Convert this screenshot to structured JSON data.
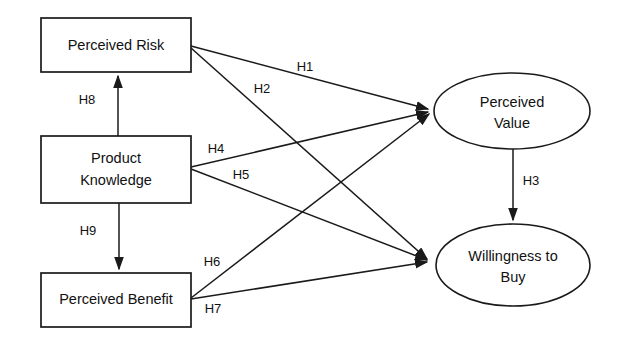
{
  "diagram": {
    "type": "path-model",
    "colors": {
      "stroke": "#1a1a1a",
      "fill": "#ffffff",
      "text": "#111111",
      "background": "#ffffff"
    },
    "nodes": [
      {
        "id": "perceived-risk",
        "shape": "rectangle",
        "label": "Perceived Risk",
        "lines": [
          "Perceived Risk"
        ],
        "x": 41,
        "y": 18,
        "w": 150,
        "h": 54
      },
      {
        "id": "product-knowledge",
        "shape": "rectangle",
        "label": "Product Knowledge",
        "lines": [
          "Product",
          "Knowledge"
        ],
        "x": 41,
        "y": 136,
        "w": 150,
        "h": 67
      },
      {
        "id": "perceived-benefit",
        "shape": "rectangle",
        "label": "Perceived Benefit",
        "lines": [
          "Perceived Benefit"
        ],
        "x": 41,
        "y": 273,
        "w": 150,
        "h": 54
      },
      {
        "id": "perceived-value",
        "shape": "ellipse",
        "label": "Perceived Value",
        "lines": [
          "Perceived",
          "Value"
        ],
        "cx": 512,
        "cy": 111,
        "rx": 78,
        "ry": 38
      },
      {
        "id": "willingness-to-buy",
        "shape": "ellipse",
        "label": "Willingness to Buy",
        "lines": [
          "Willingness to",
          "Buy"
        ],
        "cx": 513,
        "cy": 265,
        "rx": 77,
        "ry": 41
      }
    ],
    "edges": [
      {
        "id": "H1",
        "label": "H1",
        "from": "perceived-risk",
        "to": "perceived-value",
        "x1": 191,
        "y1": 46,
        "x2": 432,
        "y2": 110,
        "lx": 305,
        "ly": 68
      },
      {
        "id": "H2",
        "label": "H2",
        "from": "perceived-risk",
        "to": "willingness-to-buy",
        "x1": 191,
        "y1": 48,
        "x2": 431,
        "y2": 261,
        "lx": 262,
        "ly": 90
      },
      {
        "id": "H3",
        "label": "H3",
        "from": "perceived-value",
        "to": "willingness-to-buy",
        "x1": 513,
        "y1": 149,
        "x2": 513,
        "y2": 223,
        "lx": 531,
        "ly": 182
      },
      {
        "id": "H4",
        "label": "H4",
        "from": "product-knowledge",
        "to": "perceived-value",
        "x1": 191,
        "y1": 167,
        "x2": 431,
        "y2": 112,
        "lx": 216,
        "ly": 150
      },
      {
        "id": "H5",
        "label": "H5",
        "from": "product-knowledge",
        "to": "willingness-to-buy",
        "x1": 191,
        "y1": 169,
        "x2": 431,
        "y2": 261,
        "lx": 241,
        "ly": 176
      },
      {
        "id": "H6",
        "label": "H6",
        "from": "perceived-benefit",
        "to": "perceived-value",
        "x1": 191,
        "y1": 298,
        "x2": 432,
        "y2": 113,
        "lx": 212,
        "ly": 263
      },
      {
        "id": "H7",
        "label": "H7",
        "from": "perceived-benefit",
        "to": "willingness-to-buy",
        "x1": 191,
        "y1": 299,
        "x2": 431,
        "y2": 262,
        "lx": 213,
        "ly": 310
      },
      {
        "id": "H8",
        "label": "H8",
        "from": "product-knowledge",
        "to": "perceived-risk",
        "x1": 118,
        "y1": 136,
        "x2": 118,
        "y2": 74,
        "lx": 87,
        "ly": 101
      },
      {
        "id": "H9",
        "label": "H9",
        "from": "product-knowledge",
        "to": "perceived-benefit",
        "x1": 119,
        "y1": 203,
        "x2": 119,
        "y2": 271,
        "lx": 88,
        "ly": 232
      }
    ]
  }
}
